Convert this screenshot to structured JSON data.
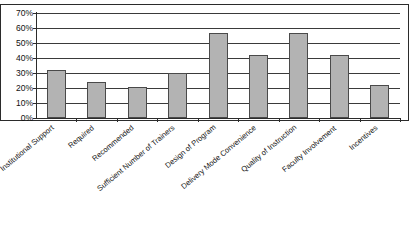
{
  "chart_data": {
    "type": "bar",
    "title": "",
    "xlabel": "",
    "ylabel": "",
    "ylim": [
      0,
      70
    ],
    "grid": true,
    "legend": "none",
    "y_tick_labels": [
      "70%",
      "60%",
      "50%",
      "40%",
      "30%",
      "20%",
      "10%",
      "0%"
    ],
    "y_tick_values": [
      70,
      60,
      50,
      40,
      30,
      20,
      10,
      0
    ],
    "categories": [
      "Institutional Support",
      "Required",
      "Recommended",
      "Sufficient Number of Trainers",
      "Design of Program",
      "Delivery Mode Convenience",
      "Quality of Instruction",
      "Faculty Involvement",
      "Incentives"
    ],
    "values": [
      32,
      24,
      21,
      30,
      57,
      42,
      57,
      42,
      22
    ],
    "value_labels": [
      "32%",
      "24%",
      "21%",
      "30%",
      "57%",
      "42%",
      "57%",
      "42%",
      "22%"
    ],
    "colors": {
      "bar_fill": "#b3b3b3",
      "bar_border": "#4a4a4a",
      "gridline": "#3a3a3a",
      "axis": "#2b2b2b",
      "text": "#141414",
      "background": "#ffffff"
    }
  }
}
